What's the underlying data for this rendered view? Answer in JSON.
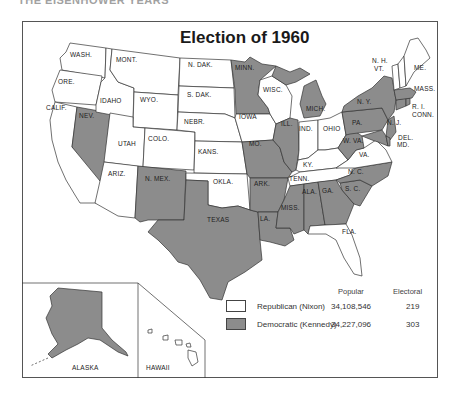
{
  "page": {
    "header_partial": "THE EISENHOWER YEARS"
  },
  "map": {
    "title": "Election of 1960",
    "colors": {
      "republican": "#ffffff",
      "democratic": "#8c8c8c",
      "border": "#333333"
    },
    "state_labels": {
      "wash": "WASH.",
      "ore": "ORE.",
      "calif": "CALIF.",
      "idaho": "IDAHO",
      "nev": "NEV.",
      "mont": "MONT.",
      "wyo": "WYO.",
      "utah": "UTAH",
      "colo": "COLO.",
      "ariz": "ARIZ.",
      "nmex": "N. MEX.",
      "ndak": "N. DAK.",
      "sdak": "S. DAK.",
      "nebr": "NEBR.",
      "kans": "KANS.",
      "okla": "OKLA.",
      "texas": "TEXAS",
      "minn": "MINN.",
      "iowa": "IOWA",
      "mo": "MO.",
      "ark": "ARK.",
      "la": "LA.",
      "wisc": "WISC.",
      "ill": "ILL.",
      "mich": "MICH.",
      "ind": "IND.",
      "ohio": "OHIO",
      "ky": "KY.",
      "tenn": "TENN.",
      "miss": "MISS.",
      "ala": "ALA.",
      "ga": "GA.",
      "fla": "FLA.",
      "sc": "S. C.",
      "nc": "N. C.",
      "va": "VA.",
      "wva": "W. VA.",
      "pa": "PA.",
      "ny": "N. Y.",
      "nj": "N. J.",
      "del": "DEL.",
      "md": "MD.",
      "conn": "CONN.",
      "ri": "R. I.",
      "mass": "MASS.",
      "vt": "VT.",
      "nh": "N. H.",
      "me": "ME.",
      "alaska": "ALASKA",
      "hawaii": "HAWAII"
    },
    "states_democratic": [
      "NEV.",
      "N. MEX.",
      "TEXAS",
      "MINN.",
      "MO.",
      "ARK.",
      "LA.",
      "ILL.",
      "MICH.",
      "MISS.",
      "ALA.",
      "GA.",
      "S. C.",
      "N. C.",
      "W. VA.",
      "PA.",
      "N. Y.",
      "N. J.",
      "DEL.",
      "MD.",
      "CONN.",
      "R. I.",
      "MASS.",
      "ALASKA"
    ],
    "states_republican": [
      "WASH.",
      "ORE.",
      "CALIF.",
      "IDAHO",
      "MONT.",
      "WYO.",
      "UTAH",
      "COLO.",
      "ARIZ.",
      "N. DAK.",
      "S. DAK.",
      "NEBR.",
      "KANS.",
      "OKLA.",
      "IOWA",
      "WISC.",
      "IND.",
      "OHIO",
      "KY.",
      "TENN.",
      "FLA.",
      "VA.",
      "VT.",
      "N. H.",
      "ME.",
      "HAWAII"
    ]
  },
  "legend": {
    "col_popular": "Popular",
    "col_electoral": "Electoral",
    "rows": [
      {
        "party": "Republican (Nixon)",
        "popular": "34,108,546",
        "electoral": "219",
        "color": "#ffffff"
      },
      {
        "party": "Democratic (Kennedy)",
        "popular": "34,227,096",
        "electoral": "303",
        "color": "#8c8c8c"
      }
    ]
  }
}
